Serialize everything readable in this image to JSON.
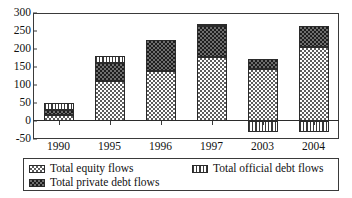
{
  "chart_data": {
    "type": "bar",
    "stacked": true,
    "title": "",
    "xlabel": "",
    "ylabel": "",
    "categories": [
      "1990",
      "1995",
      "1996",
      "1997",
      "2003",
      "2004"
    ],
    "ylim": [
      -50,
      300
    ],
    "yticks": [
      300,
      250,
      200,
      150,
      100,
      50,
      0,
      -50
    ],
    "grid": false,
    "legend_position": "bottom",
    "series": [
      {
        "name": "Total equity flows",
        "pattern": "fine-checker-light",
        "color": "#5e5e5e",
        "values": [
          18,
          110,
          140,
          178,
          145,
          206
        ]
      },
      {
        "name": "Total private debt flows",
        "pattern": "dark-checker",
        "color": "#1d1d1d",
        "values": [
          12,
          50,
          85,
          85,
          28,
          58
        ]
      },
      {
        "name": "Total official debt flows",
        "pattern": "vertical-stripes",
        "color": "#3a3a3a",
        "values": [
          20,
          21,
          0,
          5,
          -30,
          -30
        ]
      }
    ],
    "totals": [
      50,
      181,
      225,
      268,
      173,
      264
    ]
  },
  "legend": {
    "items": [
      {
        "label": "Total equity flows",
        "swatch": "pat-equity"
      },
      {
        "label": "Total official debt flows",
        "swatch": "pat-official"
      },
      {
        "label": "Total private debt flows",
        "swatch": "pat-private"
      }
    ]
  }
}
